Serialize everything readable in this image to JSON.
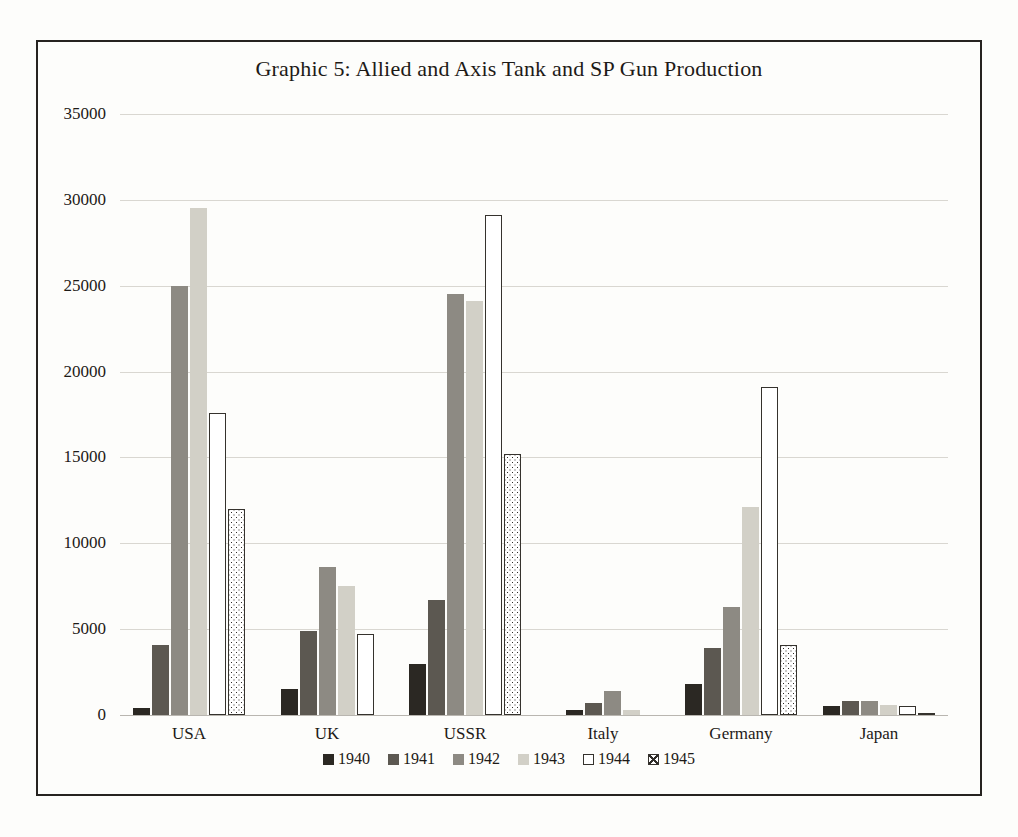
{
  "chart_data": {
    "type": "bar",
    "title": "Graphic 5: Allied and Axis Tank and SP Gun Production",
    "xlabel": "",
    "ylabel": "",
    "ylim": [
      0,
      35000
    ],
    "ytick_labels": [
      "35000",
      "30000",
      "25000",
      "20000",
      "15000",
      "10000",
      "5000",
      "0"
    ],
    "ytick_values": [
      35000,
      30000,
      25000,
      20000,
      15000,
      10000,
      5000,
      0
    ],
    "grid": true,
    "legend_position": "bottom",
    "categories": [
      "USA",
      "UK",
      "USSR",
      "Italy",
      "Germany",
      "Japan"
    ],
    "series": [
      {
        "name": "1940",
        "color": "#2b2823",
        "values": [
          400,
          1500,
          3000,
          300,
          1800,
          500
        ]
      },
      {
        "name": "1941",
        "color": "#5c5851",
        "values": [
          4100,
          4900,
          6700,
          700,
          3900,
          800
        ]
      },
      {
        "name": "1942",
        "color": "#8d8a83",
        "values": [
          25000,
          8600,
          24500,
          1400,
          6300,
          800
        ]
      },
      {
        "name": "1943",
        "color": "#d2d0c7",
        "values": [
          29500,
          7500,
          24100,
          300,
          12100,
          600
        ]
      },
      {
        "name": "1944",
        "color": "#ffffff",
        "values": [
          17600,
          4700,
          29100,
          0,
          19100,
          500
        ]
      },
      {
        "name": "1945",
        "color": "#ffffff",
        "values": [
          12000,
          0,
          15200,
          0,
          4100,
          100
        ]
      }
    ]
  },
  "legend": {
    "items": [
      {
        "label": "1940"
      },
      {
        "label": "1941"
      },
      {
        "label": "1942"
      },
      {
        "label": "1943"
      },
      {
        "label": "1944"
      },
      {
        "label": "1945"
      }
    ]
  }
}
